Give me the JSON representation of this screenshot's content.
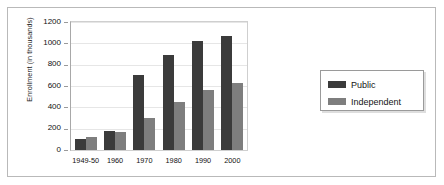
{
  "chart_data": {
    "type": "bar",
    "title": "",
    "subtitle": "",
    "xlabel": "",
    "ylabel": "Enrollment (in thousands)",
    "categories": [
      "1949-50",
      "1960",
      "1970",
      "1980",
      "1990",
      "2000"
    ],
    "series": [
      {
        "name": "Public",
        "color": "#3b3b3b",
        "values": [
          105,
          180,
          700,
          890,
          1020,
          1070
        ]
      },
      {
        "name": "Independent",
        "color": "#7e7e7e",
        "values": [
          125,
          170,
          300,
          450,
          560,
          630
        ]
      }
    ],
    "ylim": [
      0,
      1200
    ],
    "yticks": [
      1200,
      1000,
      800,
      600,
      400,
      200,
      0
    ],
    "ytick_labels": [
      "1200",
      "1000",
      "800",
      "600",
      "400",
      "200",
      "0"
    ],
    "grid": true,
    "legend_position": "right",
    "legend_entries": [
      "Public",
      "Independent"
    ]
  },
  "figure": {
    "background_color": "#ffffff",
    "frame_color": "#b9b9b9",
    "plot_border_color": "#cfcfcf",
    "axis_color": "#a8a8a8",
    "gridline_color": "#e6e6e6"
  }
}
